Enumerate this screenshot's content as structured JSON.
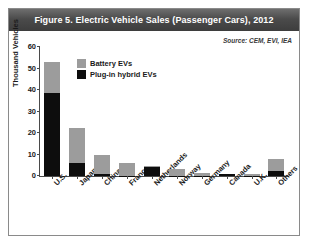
{
  "figure": {
    "title": "Figure 5. Electric Vehicle Sales (Passenger Cars), 2012",
    "source": "Source: CEM, EVI, IEA"
  },
  "colors": {
    "battery_ev": "#9c9c9c",
    "plugin_hybrid_ev": "#0d0d0d",
    "title_bar": "#4b4b4b",
    "axis": "#4a4a4a"
  },
  "chart_data": {
    "type": "bar",
    "stacked": true,
    "title": "Figure 5. Electric Vehicle Sales (Passenger Cars), 2012",
    "xlabel": "",
    "ylabel": "Thousand Vehicles",
    "ylim": [
      0,
      60
    ],
    "yticks": [
      0,
      10,
      20,
      30,
      40,
      50,
      60
    ],
    "grid": false,
    "legend_position": "upper-center",
    "categories": [
      "U.S.",
      "Japan",
      "China",
      "France",
      "Netherlands",
      "Norway",
      "Germany",
      "Canada",
      "U.K.",
      "Others"
    ],
    "series": [
      {
        "name": "Battery EVs",
        "color": "#9c9c9c",
        "values": [
          14.2,
          16.5,
          9.0,
          6.0,
          0.3,
          3.0,
          1.1,
          0.1,
          0.8,
          5.5
        ]
      },
      {
        "name": "Plug-in hybrid EVs",
        "color": "#0d0d0d",
        "values": [
          38.8,
          6.0,
          1.0,
          0.2,
          4.3,
          0.1,
          0.1,
          1.0,
          0.1,
          2.5
        ]
      }
    ],
    "totals": [
      53.0,
      22.5,
      10.0,
      6.2,
      4.6,
      3.1,
      1.2,
      1.1,
      0.9,
      8.0
    ],
    "annotations": [
      "Source: CEM, EVI, IEA"
    ]
  }
}
